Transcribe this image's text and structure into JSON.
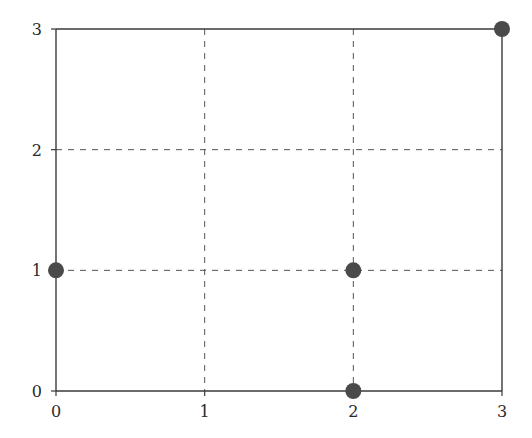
{
  "chart_data": {
    "type": "scatter",
    "title": "",
    "xlabel": "",
    "ylabel": "",
    "xlim": [
      0,
      3
    ],
    "ylim": [
      0,
      3
    ],
    "x_ticks": [
      "0",
      "1",
      "2",
      "3"
    ],
    "y_ticks": [
      "0",
      "1",
      "2",
      "3"
    ],
    "grid": true,
    "grid_style": "dashed",
    "legend": null,
    "series": [
      {
        "name": "points",
        "points": [
          {
            "x": 0,
            "y": 1
          },
          {
            "x": 2,
            "y": 1
          },
          {
            "x": 2,
            "y": 0
          },
          {
            "x": 3,
            "y": 3
          }
        ]
      }
    ]
  },
  "colors": {
    "axis": "#3a3a3a",
    "grid": "#555555",
    "marker": "#4a4a4a",
    "text": "#2a2a2a"
  }
}
